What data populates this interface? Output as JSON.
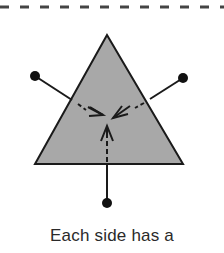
{
  "diagram": {
    "caption": "Each side has a",
    "triangle_fill": "#a8a8a8",
    "stroke_color": "#1a1a1a",
    "dashed_border_color": "#444444",
    "arrows": [
      "left-side",
      "right-side",
      "bottom-side"
    ]
  }
}
